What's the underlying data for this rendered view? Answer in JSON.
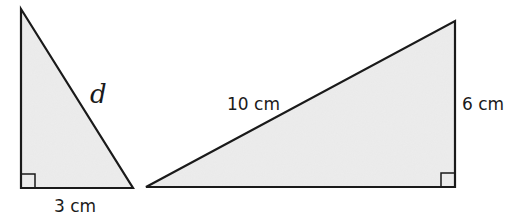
{
  "figure": {
    "fill_color": "#e9e9e9",
    "stroke_color": "#1a1a1a",
    "triangles": [
      {
        "id": "left-triangle",
        "right_angle": "bottom-left",
        "labels": {
          "base": "3 cm",
          "hypotenuse": "d"
        }
      },
      {
        "id": "right-triangle",
        "right_angle": "bottom-right",
        "labels": {
          "hypotenuse": "10 cm",
          "height": "6 cm"
        }
      }
    ]
  }
}
